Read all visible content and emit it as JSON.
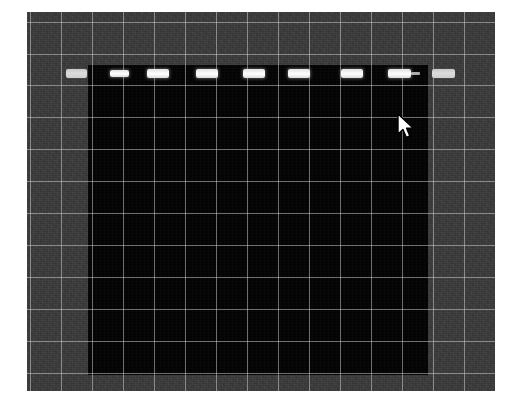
{
  "capture": {
    "title": "Grayscale lane image with grid overlay",
    "background_color": "#ffffff",
    "plate_color": "#3a3a3a",
    "dark_region_color": "#050505",
    "grid_color": "#d7d7d7",
    "band_color": "#ffffff",
    "plate": {
      "x": 27,
      "y": 12,
      "width": 468,
      "height": 379
    },
    "dark_region": {
      "x": 88,
      "y": 65,
      "width": 340,
      "height": 310
    }
  },
  "grid": {
    "visible": true,
    "spacing_x": 31,
    "spacing_y": 32,
    "vertical_x": [
      3,
      34,
      65,
      96,
      127,
      158,
      189,
      220,
      251,
      282,
      313,
      344,
      375,
      406,
      437
    ],
    "horizontal_y": [
      10,
      42,
      73,
      105,
      137,
      169,
      201,
      233,
      265,
      297,
      329,
      361
    ]
  },
  "bands": [
    {
      "label": "band-1",
      "x": 39,
      "y": 57,
      "width": 21,
      "height": 9,
      "intensity": "dim",
      "tail": false
    },
    {
      "label": "band-2",
      "x": 83,
      "y": 58,
      "width": 19,
      "height": 7,
      "intensity": "bright",
      "tail": false
    },
    {
      "label": "band-3",
      "x": 120,
      "y": 57,
      "width": 22,
      "height": 9,
      "intensity": "bright",
      "tail": false
    },
    {
      "label": "band-4",
      "x": 169,
      "y": 57,
      "width": 22,
      "height": 9,
      "intensity": "bright",
      "tail": false
    },
    {
      "label": "band-5",
      "x": 216,
      "y": 57,
      "width": 22,
      "height": 9,
      "intensity": "bright",
      "tail": false
    },
    {
      "label": "band-6",
      "x": 261,
      "y": 57,
      "width": 22,
      "height": 9,
      "intensity": "bright",
      "tail": false
    },
    {
      "label": "band-7",
      "x": 314,
      "y": 57,
      "width": 22,
      "height": 9,
      "intensity": "bright",
      "tail": false
    },
    {
      "label": "band-8",
      "x": 361,
      "y": 57,
      "width": 23,
      "height": 9,
      "intensity": "bright",
      "tail": true
    },
    {
      "label": "band-9",
      "x": 405,
      "y": 57,
      "width": 23,
      "height": 9,
      "intensity": "dim",
      "tail": false
    }
  ],
  "cursor": {
    "name": "arrow-pointer",
    "x": 396,
    "y": 113,
    "color": "#ffffff",
    "outline_color": "#000000"
  }
}
